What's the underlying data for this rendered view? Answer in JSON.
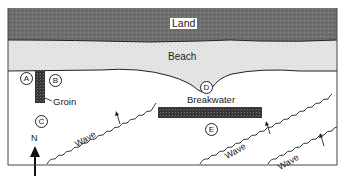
{
  "diagram": {
    "regions": {
      "land": "Land",
      "beach": "Beach"
    },
    "structures": {
      "groin": "Groin",
      "breakwater": "Breakwater"
    },
    "points": [
      "A",
      "B",
      "C",
      "D",
      "E"
    ],
    "compass": {
      "label": "N",
      "direction": "north"
    },
    "waves": [
      {
        "label": "Wave"
      },
      {
        "label": "Wave"
      },
      {
        "label": "Wave"
      }
    ],
    "colors": {
      "land": "#6e6e6e",
      "beach": "#e4e4e4",
      "water": "#ffffff",
      "structure": "#3a3a3a",
      "line": "#222222"
    }
  }
}
